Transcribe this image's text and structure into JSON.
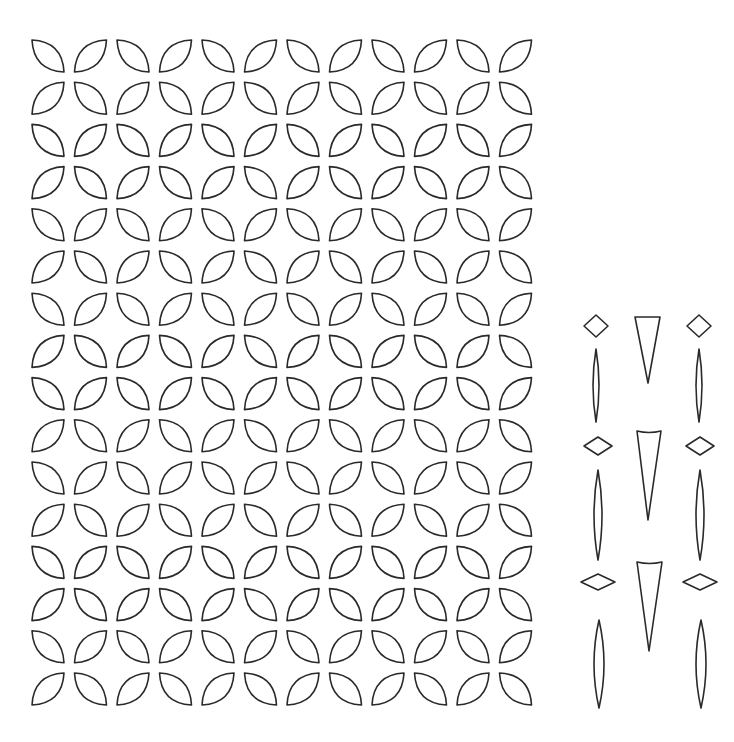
{
  "canvas": {
    "width": 734,
    "height": 742,
    "background": "#ffffff",
    "stroke_color": "#2a2a2a"
  },
  "leaf_grid": {
    "rows": 16,
    "cols": 12,
    "origin_x": 32,
    "origin_y": 40,
    "pitch_x": 42.5,
    "pitch_y": 42.2,
    "leaf_size": 32,
    "bulge": 9,
    "pattern": "even rows start with backslash leaf, alternating; odd rows start with slash leaf"
  },
  "ornaments": {
    "diamonds": [
      {
        "cx": 596,
        "cy": 326,
        "w": 24,
        "h": 22
      },
      {
        "cx": 699,
        "cy": 326,
        "w": 24,
        "h": 22
      },
      {
        "cx": 598,
        "cy": 446,
        "w": 28,
        "h": 18
      },
      {
        "cx": 700,
        "cy": 446,
        "w": 28,
        "h": 18
      },
      {
        "cx": 598,
        "cy": 582,
        "w": 34,
        "h": 16
      },
      {
        "cx": 700,
        "cy": 582,
        "w": 34,
        "h": 16
      }
    ],
    "spindles": [
      {
        "cx": 596,
        "top": 349,
        "bottom": 422,
        "w": 6
      },
      {
        "cx": 699,
        "top": 349,
        "bottom": 422,
        "w": 6
      },
      {
        "cx": 598,
        "top": 470,
        "bottom": 560,
        "w": 8
      },
      {
        "cx": 700,
        "top": 470,
        "bottom": 560,
        "w": 8
      },
      {
        "cx": 599,
        "top": 620,
        "bottom": 708,
        "w": 10
      },
      {
        "cx": 701,
        "top": 620,
        "bottom": 708,
        "w": 10
      }
    ],
    "triangles": [
      {
        "left": 635,
        "right": 660,
        "top": 317,
        "tip_x": 648,
        "tip_y": 383,
        "curve": 0
      },
      {
        "left": 637,
        "right": 661,
        "top": 431,
        "tip_x": 648,
        "tip_y": 520,
        "curve": 3
      },
      {
        "left": 637,
        "right": 662,
        "top": 562,
        "tip_x": 649,
        "tip_y": 651,
        "curve": 3
      }
    ]
  }
}
